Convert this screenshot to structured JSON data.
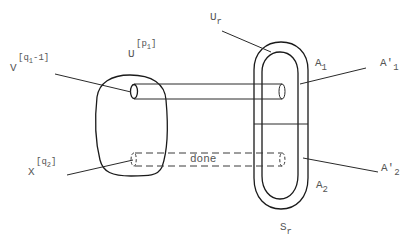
{
  "diagram": {
    "labels": {
      "v": {
        "base": "V",
        "sup_open": "[",
        "sup_var": "q",
        "sup_sub": "1",
        "sup_rest": "-1]"
      },
      "u": {
        "base": "U",
        "sup_open": "[",
        "sup_var": "p",
        "sup_sub": "1",
        "sup_close": "]"
      },
      "x": {
        "base": "X",
        "sup_open": "[",
        "sup_var": "q",
        "sup_sub": "2",
        "sup_close": "]"
      },
      "ur": {
        "base": "U",
        "sub": "r"
      },
      "a1": {
        "base": "A",
        "sub": "1"
      },
      "a1p": {
        "base": "A'",
        "sub": "1"
      },
      "a2": {
        "base": "A",
        "sub": "2"
      },
      "a2p": {
        "base": "A'",
        "sub": "2"
      },
      "sr": {
        "base": "S",
        "sub": "r"
      },
      "done": "done"
    },
    "shapes": {
      "left_blob": "rounded region containing tube ends",
      "right_loop": "double-walled elongated loop split into A1 (upper) and A2 (lower)",
      "solid_tube": "tube from left blob to upper loop",
      "dashed_tube": "dashed tube from left blob to lower loop"
    },
    "colors": {
      "stroke": "#1a1a1a",
      "text": "#555555"
    }
  }
}
